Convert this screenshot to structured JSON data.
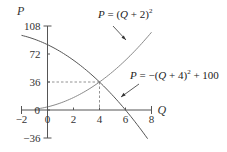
{
  "chart_data": {
    "type": "line",
    "title": "",
    "xlabel": "Q",
    "ylabel": "P",
    "xlim": [
      -2,
      8
    ],
    "ylim": [
      -36,
      108
    ],
    "grid": false,
    "x_ticks": [
      -2,
      0,
      2,
      4,
      6,
      8
    ],
    "x_tick_labels": [
      "−2",
      "0",
      "2",
      "4",
      "6",
      "8"
    ],
    "y_ticks": [
      -36,
      0,
      36,
      72,
      108
    ],
    "y_tick_labels": [
      "−36",
      "0",
      "36",
      "72",
      "108"
    ],
    "series": [
      {
        "name": "P = (Q + 2)^2",
        "label_main": "P = (Q + 2)",
        "label_sup": "2",
        "color": "#8a8a8a",
        "x_range": [
          -1,
          8
        ],
        "x": [
          -1,
          0,
          1,
          2,
          3,
          4,
          5,
          6,
          7,
          8
        ],
        "values": [
          1,
          4,
          9,
          16,
          25,
          36,
          49,
          64,
          81,
          100
        ]
      },
      {
        "name": "P = −(Q + 4)^2 + 100",
        "label_main": "P = −(Q + 4)",
        "label_sup": "2",
        "label_tail": " + 100",
        "color": "#555555",
        "x_range": [
          -2,
          7.7
        ],
        "x": [
          -2,
          -1,
          0,
          1,
          2,
          3,
          4,
          5,
          6,
          7,
          7.7
        ],
        "values": [
          96,
          91,
          84,
          75,
          64,
          51,
          36,
          19,
          0,
          -21,
          -36.9
        ]
      }
    ],
    "annotations": [
      {
        "type": "intersection",
        "x": 4,
        "y": 36,
        "guides": "dashed"
      }
    ],
    "legend": "inline-labels-with-arrows"
  }
}
